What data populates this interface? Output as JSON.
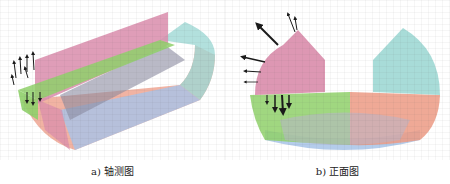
{
  "figure": {
    "panels": [
      {
        "id": "a",
        "caption": "a) 轴测图",
        "view": "axonometric"
      },
      {
        "id": "b",
        "caption": "b) 正面图",
        "view": "front"
      }
    ],
    "colors": {
      "pink": "#d98cab",
      "green": "#8fd06a",
      "cyan": "#9fd8d4",
      "blue": "#a7c3e8",
      "salmon": "#ec9a84",
      "gray": "#8a8aa0",
      "arrow": "#1a1a1a"
    }
  }
}
